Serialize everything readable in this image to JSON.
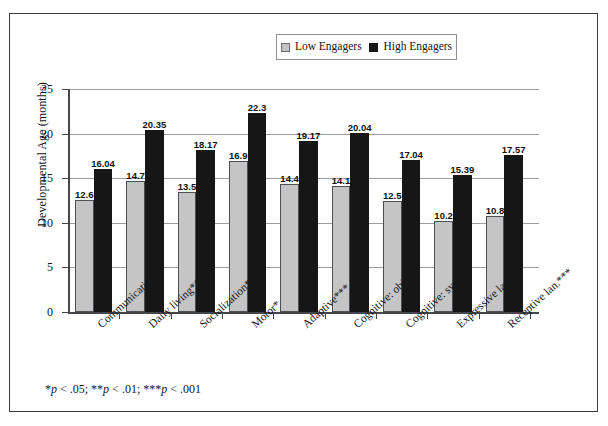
{
  "chart_data": {
    "type": "bar",
    "title": "",
    "xlabel": "",
    "ylabel": "Developmental Age (months)",
    "ylim": [
      0,
      25
    ],
    "ytick_step": 5,
    "yticks": [
      "0",
      "5",
      "10",
      "15",
      "20",
      "25"
    ],
    "grid": true,
    "legend_position": "top-center",
    "categories": [
      "Communication**",
      "Daily living***",
      "Socialization***",
      "Motor*",
      "Adaptive***",
      "Cognitive: obj.**",
      "Cognitive: sym.*",
      "Expressive lan.**",
      "Receptive lan.***"
    ],
    "series": [
      {
        "name": "Low Engagers",
        "color": "#c5c5c5",
        "values": [
          12.6,
          14.7,
          13.5,
          16.9,
          14.4,
          14.1,
          12.5,
          10.2,
          10.8
        ],
        "labels": [
          "12.6",
          "14.7",
          "13.5",
          "16.9",
          "14.4",
          "14.1",
          "12.5",
          "10.2",
          "10.8"
        ]
      },
      {
        "name": "High Engagers",
        "color": "#161616",
        "values": [
          16.04,
          20.35,
          18.17,
          22.3,
          19.17,
          20.04,
          17.04,
          15.39,
          17.57
        ],
        "labels": [
          "16.04",
          "20.35",
          "18.17",
          "22.3",
          "19.17",
          "20.04",
          "17.04",
          "15.39",
          "17.57"
        ]
      }
    ],
    "footnote": "*p < .05; **p < .01; ***p < .001"
  },
  "legend": {
    "low_label": "Low Engagers",
    "high_label": "High Engagers"
  },
  "footnote": {
    "star1": "*",
    "p1": "p",
    "rest1": " < .05; ",
    "star2": "**",
    "p2": "p",
    "rest2": " < .01; ",
    "star3": "***",
    "p3": "p",
    "rest3": " < .001"
  }
}
